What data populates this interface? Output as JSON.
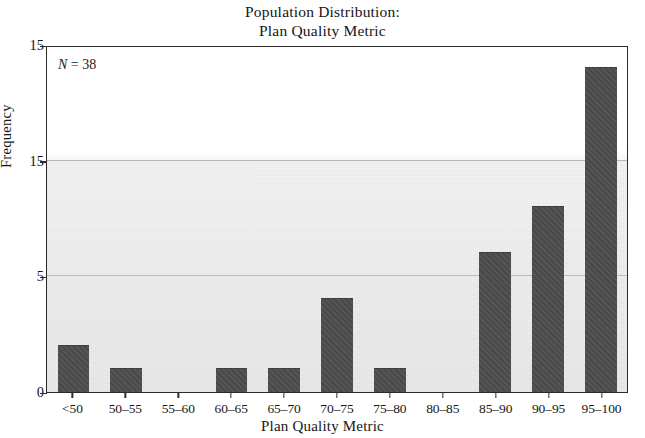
{
  "chart_data": {
    "type": "bar",
    "title": "Population Distribution: Plan Quality Metric",
    "title_lines": [
      "Population Distribution:",
      "Plan Quality Metric"
    ],
    "xlabel": "Plan Quality Metric",
    "ylabel": "Frequency",
    "categories": [
      "<50",
      "50–55",
      "55–60",
      "60–65",
      "65–70",
      "70–75",
      "75–80",
      "80–85",
      "85–90",
      "90–95",
      "95–100"
    ],
    "values": [
      2,
      1,
      0,
      1,
      1,
      4,
      1,
      0,
      6,
      8,
      14
    ],
    "ylim": [
      0,
      15
    ],
    "ytick_labels": [
      "0",
      "5",
      "15",
      "15"
    ],
    "ytick_values": [
      0,
      5,
      10,
      15
    ],
    "gridlines": [
      5,
      10
    ],
    "grid": true,
    "legend": "none",
    "annotations": [
      {
        "name": "sample-size",
        "symbol": "N",
        "text": " = 38",
        "full_text": "N = 38",
        "value": 38
      }
    ],
    "bar_color": "#4d4d4d",
    "grid_color": "#b9b9b9",
    "axis_color": "#2b2b2b",
    "background_color": "#ffffff"
  }
}
